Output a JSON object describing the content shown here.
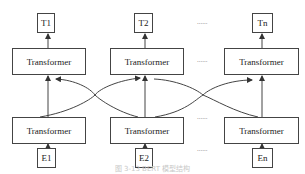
{
  "outputs": [
    {
      "label": "T1"
    },
    {
      "label": "T2"
    },
    {
      "label": "Tn"
    }
  ],
  "top_layer": [
    {
      "label": "Transformer"
    },
    {
      "label": "Transformer"
    },
    {
      "label": "Transformer"
    }
  ],
  "bottom_layer": [
    {
      "label": "Transformer"
    },
    {
      "label": "Transformer"
    },
    {
      "label": "Transformer"
    }
  ],
  "inputs": [
    {
      "label": "E1"
    },
    {
      "label": "E2"
    },
    {
      "label": "En"
    }
  ],
  "ellipsis": "......",
  "caption": "图 3-13 BERT 模型结构",
  "colors": {
    "stroke": "#444444",
    "background": "#ffffff"
  }
}
